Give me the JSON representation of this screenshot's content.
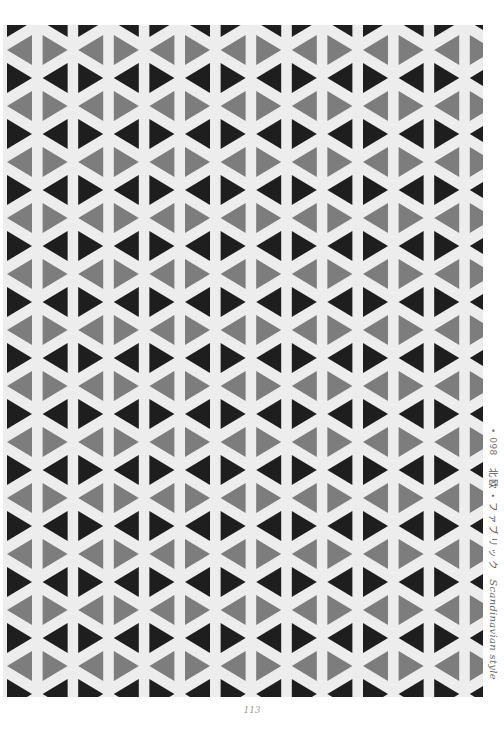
{
  "page": {
    "page_number": "113",
    "caption": {
      "number": "• 098",
      "title_jp": "北欧・ファブリック",
      "title_en": "Scandinavian style"
    }
  },
  "pattern": {
    "name": "triangle-zigzag",
    "colors": {
      "background": "#ededed",
      "dark": "#1e1e1e",
      "gray": "#7d7d7d",
      "paper": "#ffffff"
    },
    "column_width": 35.6,
    "row_pair_height": 56,
    "columns": 14,
    "rows": 13
  }
}
